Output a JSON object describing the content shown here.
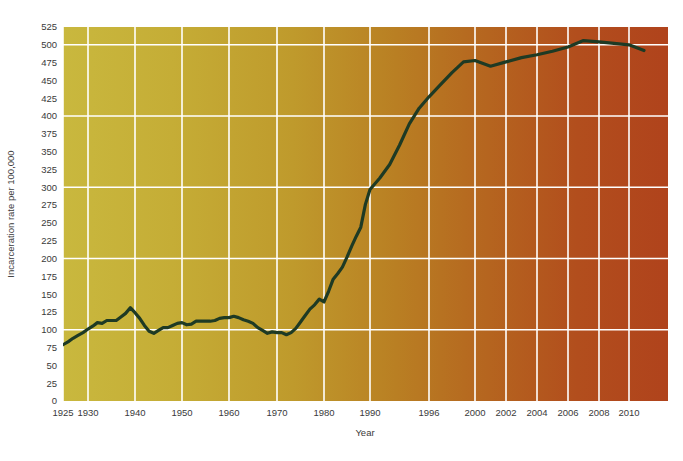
{
  "chart_data": {
    "type": "line",
    "title": "",
    "xlabel": "Year",
    "ylabel": "Incarceration rate per 100,000",
    "xlim": [
      1925,
      2011
    ],
    "ylim": [
      0,
      525
    ],
    "grid": true,
    "legend": null,
    "line_color": "#1e3a24",
    "background_gradient": [
      "#c8b63c",
      "#c19a2c",
      "#b97d22",
      "#b4501f",
      "#b0431c"
    ],
    "x_tick_labels": [
      "1925",
      "1930",
      "1940",
      "1950",
      "1960",
      "1970",
      "1980",
      "1990",
      "1996",
      "2000",
      "2002",
      "2004",
      "2006",
      "2008",
      "2010"
    ],
    "x_tick_values": [
      1925,
      1930,
      1940,
      1950,
      1960,
      1970,
      1980,
      1990,
      1996,
      2000,
      2002,
      2004,
      2006,
      2008,
      2010
    ],
    "y_tick_labels": [
      "0",
      "25",
      "50",
      "75",
      "100",
      "125",
      "150",
      "175",
      "200",
      "225",
      "250",
      "275",
      "300",
      "325",
      "350",
      "375",
      "400",
      "425",
      "450",
      "475",
      "500",
      "525"
    ],
    "y_tick_values": [
      0,
      25,
      50,
      75,
      100,
      125,
      150,
      175,
      200,
      225,
      250,
      275,
      300,
      325,
      350,
      375,
      400,
      425,
      450,
      475,
      500,
      525
    ],
    "y_gridlines": [
      100,
      200,
      300,
      400,
      500
    ],
    "x_gridlines": [
      1925,
      1930,
      1940,
      1950,
      1960,
      1970,
      1980,
      1990,
      1996,
      2000,
      2002,
      2004,
      2006,
      2008,
      2010
    ],
    "series": [
      {
        "name": "Incarceration rate",
        "x": [
          1925,
          1926,
          1927,
          1928,
          1929,
          1930,
          1931,
          1932,
          1933,
          1934,
          1935,
          1936,
          1937,
          1938,
          1939,
          1940,
          1941,
          1942,
          1943,
          1944,
          1945,
          1946,
          1947,
          1948,
          1949,
          1950,
          1951,
          1952,
          1953,
          1954,
          1955,
          1956,
          1957,
          1958,
          1959,
          1960,
          1961,
          1962,
          1963,
          1964,
          1965,
          1966,
          1967,
          1968,
          1969,
          1970,
          1971,
          1972,
          1973,
          1974,
          1975,
          1976,
          1977,
          1978,
          1979,
          1980,
          1981,
          1982,
          1983,
          1984,
          1985,
          1986,
          1987,
          1988,
          1989,
          1990,
          1991,
          1992,
          1993,
          1994,
          1995,
          1996,
          1997,
          1998,
          1999,
          2000,
          2001,
          2002,
          2003,
          2004,
          2005,
          2006,
          2007,
          2008,
          2009,
          2010,
          2011
        ],
        "values": [
          79,
          83,
          88,
          92,
          96,
          101,
          105,
          110,
          109,
          113,
          113,
          113,
          118,
          123,
          131,
          124,
          116,
          106,
          98,
          95,
          99,
          103,
          103,
          106,
          109,
          110,
          107,
          108,
          112,
          112,
          112,
          112,
          113,
          116,
          117,
          117,
          119,
          117,
          114,
          112,
          109,
          103,
          99,
          95,
          97,
          96,
          96,
          93,
          96,
          102,
          111,
          120,
          129,
          135,
          143,
          139,
          154,
          171,
          179,
          188,
          202,
          217,
          231,
          244,
          276,
          297,
          313,
          332,
          359,
          389,
          411,
          427,
          444,
          461,
          476,
          478,
          470,
          476,
          482,
          486,
          491,
          497,
          506,
          504,
          502,
          500,
          492
        ]
      }
    ]
  },
  "axes": {
    "y_axis_label": "Incarceration rate per 100,000",
    "x_axis_label": "Year"
  }
}
